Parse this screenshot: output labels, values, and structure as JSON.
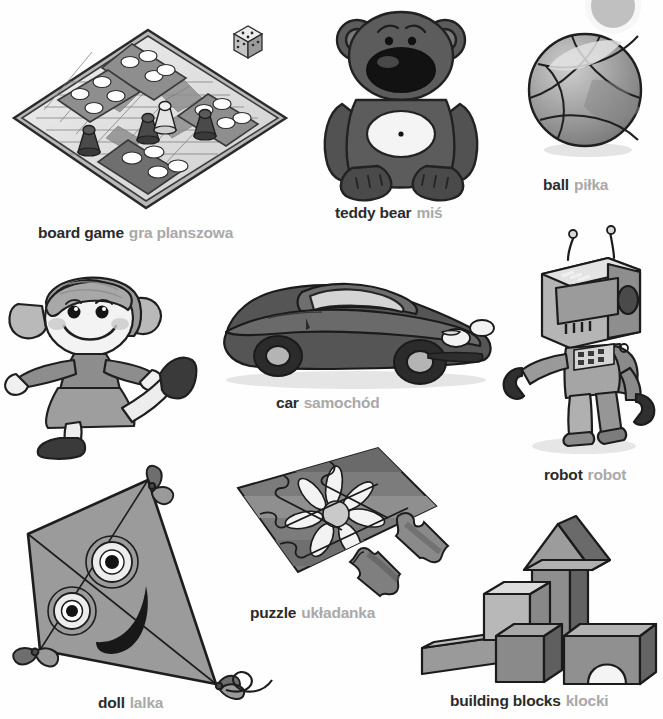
{
  "page": {
    "language_pair": "English - Polish",
    "style": "grayscale illustrations"
  },
  "palette": {
    "english_text": "#2b2b2b",
    "polish_text": "#a9a9a9",
    "background": "#ffffff",
    "ink": "#1a1a1a",
    "mid_gray": "#8a8a8a",
    "light_gray": "#d7d7d7",
    "dark_gray": "#4a4a4a"
  },
  "items": [
    {
      "id": "board-game",
      "en": "board game",
      "pl": "gra planszowa",
      "icon": "ludo-board-icon",
      "details": [
        "board",
        "pawns",
        "die"
      ]
    },
    {
      "id": "teddy-bear",
      "en": "teddy bear",
      "pl": "miś",
      "icon": "teddy-bear-icon",
      "details": [
        "ears",
        "muzzle",
        "belly patch"
      ]
    },
    {
      "id": "ball",
      "en": "ball",
      "pl": "piłka",
      "icon": "ball-icon",
      "details": [
        "curved seams"
      ]
    },
    {
      "id": "doll",
      "en": "doll",
      "pl": "lalka",
      "icon": "doll-icon",
      "details": [
        "pigtails",
        "dress",
        "shoes"
      ]
    },
    {
      "id": "car",
      "en": "car",
      "pl": "samochód",
      "icon": "sports-car-icon",
      "details": [
        "headlights",
        "wheels",
        "windscreen"
      ]
    },
    {
      "id": "robot",
      "en": "robot",
      "pl": "robot",
      "icon": "robot-icon",
      "details": [
        "antennae",
        "screen face",
        "keypad",
        "claw hands"
      ]
    },
    {
      "id": "kite",
      "en": "kite",
      "pl": "latawiec",
      "icon": "kite-icon",
      "details": [
        "diamond sail",
        "eyes",
        "smile",
        "tail bows"
      ]
    },
    {
      "id": "puzzle",
      "en": "puzzle",
      "pl": "układanka",
      "icon": "jigsaw-puzzle-icon",
      "details": [
        "flower picture",
        "loose pieces"
      ]
    },
    {
      "id": "building-blocks",
      "en": "building blocks",
      "pl": "klocki",
      "icon": "building-blocks-icon",
      "details": [
        "beam",
        "cubes",
        "tower",
        "roof",
        "arch"
      ]
    }
  ]
}
